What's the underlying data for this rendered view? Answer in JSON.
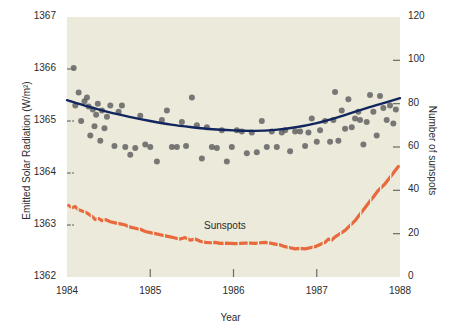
{
  "chart_data": {
    "type": "scatter",
    "title": "",
    "xlabel": "Year",
    "ylabel": "Emitted Solar Radiation (W/m²)",
    "ylabel_right": "Number of sunspots",
    "xlim": [
      1984,
      1988
    ],
    "ylim": [
      1362,
      1367
    ],
    "ylim_right": [
      0,
      120
    ],
    "grid": false,
    "legend": "none",
    "plot_background": "#eceadb",
    "xticks": [
      1984,
      1985,
      1986,
      1987,
      1988
    ],
    "xtick_labels": [
      "1984",
      "1985",
      "1986",
      "1987",
      "1988"
    ],
    "yticks_left": [
      1362,
      1363,
      1364,
      1365,
      1366,
      1367
    ],
    "ytick_labels_left": [
      "1362",
      "1363",
      "1364",
      "1365",
      "1366",
      "1367"
    ],
    "yticks_right": [
      0,
      20,
      40,
      60,
      80,
      100,
      120
    ],
    "ytick_labels_right": [
      "0",
      "20",
      "40",
      "60",
      "80",
      "100",
      "120"
    ],
    "annotations": [
      {
        "text": "Sunspots",
        "x": 1986.2,
        "y_right": 22
      }
    ],
    "series": [
      {
        "name": "Emitted Solar Radiation",
        "type": "scatter",
        "axis": "left",
        "color": "#5e5e5e",
        "marker": "circle",
        "marker_size": 6,
        "points": [
          [
            1984.08,
            1366.02
          ],
          [
            1984.1,
            1365.3
          ],
          [
            1984.14,
            1365.55
          ],
          [
            1984.17,
            1365.0
          ],
          [
            1984.21,
            1365.38
          ],
          [
            1984.24,
            1365.45
          ],
          [
            1984.26,
            1365.28
          ],
          [
            1984.28,
            1364.72
          ],
          [
            1984.31,
            1365.22
          ],
          [
            1984.33,
            1364.9
          ],
          [
            1984.35,
            1365.12
          ],
          [
            1984.37,
            1365.33
          ],
          [
            1984.4,
            1364.62
          ],
          [
            1984.42,
            1365.2
          ],
          [
            1984.45,
            1364.86
          ],
          [
            1984.48,
            1365.08
          ],
          [
            1984.52,
            1365.3
          ],
          [
            1984.57,
            1364.52
          ],
          [
            1984.62,
            1365.18
          ],
          [
            1984.66,
            1365.3
          ],
          [
            1984.7,
            1364.5
          ],
          [
            1984.76,
            1364.35
          ],
          [
            1984.82,
            1364.48
          ],
          [
            1984.88,
            1365.1
          ],
          [
            1984.94,
            1364.55
          ],
          [
            1985.0,
            1364.5
          ],
          [
            1985.08,
            1364.22
          ],
          [
            1985.14,
            1365.02
          ],
          [
            1985.2,
            1365.2
          ],
          [
            1985.26,
            1364.5
          ],
          [
            1985.32,
            1364.5
          ],
          [
            1985.38,
            1364.98
          ],
          [
            1985.43,
            1364.52
          ],
          [
            1985.5,
            1365.45
          ],
          [
            1985.56,
            1364.92
          ],
          [
            1985.62,
            1364.28
          ],
          [
            1985.68,
            1364.88
          ],
          [
            1985.74,
            1364.5
          ],
          [
            1985.8,
            1364.48
          ],
          [
            1985.86,
            1364.82
          ],
          [
            1985.92,
            1364.22
          ],
          [
            1985.98,
            1364.5
          ],
          [
            1986.04,
            1364.82
          ],
          [
            1986.1,
            1364.8
          ],
          [
            1986.16,
            1364.38
          ],
          [
            1986.22,
            1364.78
          ],
          [
            1986.28,
            1364.4
          ],
          [
            1986.34,
            1365.0
          ],
          [
            1986.4,
            1364.5
          ],
          [
            1986.46,
            1364.8
          ],
          [
            1986.52,
            1364.5
          ],
          [
            1986.58,
            1364.78
          ],
          [
            1986.62,
            1364.82
          ],
          [
            1986.68,
            1364.42
          ],
          [
            1986.74,
            1364.8
          ],
          [
            1986.8,
            1364.8
          ],
          [
            1986.86,
            1364.52
          ],
          [
            1986.9,
            1364.78
          ],
          [
            1986.94,
            1365.05
          ],
          [
            1987.0,
            1364.6
          ],
          [
            1987.04,
            1364.82
          ],
          [
            1987.1,
            1365.0
          ],
          [
            1987.16,
            1364.6
          ],
          [
            1987.2,
            1365.02
          ],
          [
            1987.22,
            1365.56
          ],
          [
            1987.26,
            1364.62
          ],
          [
            1987.3,
            1365.2
          ],
          [
            1987.34,
            1364.85
          ],
          [
            1987.38,
            1365.42
          ],
          [
            1987.42,
            1364.88
          ],
          [
            1987.46,
            1365.05
          ],
          [
            1987.5,
            1365.18
          ],
          [
            1987.52,
            1365.02
          ],
          [
            1987.56,
            1364.55
          ],
          [
            1987.6,
            1364.98
          ],
          [
            1987.64,
            1365.5
          ],
          [
            1987.68,
            1365.18
          ],
          [
            1987.72,
            1364.72
          ],
          [
            1987.76,
            1365.48
          ],
          [
            1987.8,
            1365.25
          ],
          [
            1987.84,
            1365.02
          ],
          [
            1987.88,
            1365.3
          ],
          [
            1987.92,
            1364.95
          ],
          [
            1987.95,
            1365.22
          ]
        ]
      },
      {
        "name": "Solar Radiation trend",
        "type": "line",
        "axis": "left",
        "color": "#11255e",
        "line_width": 2.4,
        "points": [
          [
            1984.0,
            1365.4
          ],
          [
            1984.25,
            1365.28
          ],
          [
            1984.5,
            1365.17
          ],
          [
            1984.75,
            1365.08
          ],
          [
            1985.0,
            1365.0
          ],
          [
            1985.25,
            1364.93
          ],
          [
            1985.5,
            1364.88
          ],
          [
            1985.75,
            1364.84
          ],
          [
            1986.0,
            1364.82
          ],
          [
            1986.25,
            1364.81
          ],
          [
            1986.5,
            1364.83
          ],
          [
            1986.75,
            1364.88
          ],
          [
            1987.0,
            1364.96
          ],
          [
            1987.25,
            1365.07
          ],
          [
            1987.5,
            1365.2
          ],
          [
            1987.75,
            1365.32
          ],
          [
            1988.0,
            1365.44
          ]
        ]
      },
      {
        "name": "Sunspots",
        "type": "line",
        "axis": "right",
        "color": "#e8693c",
        "line_width": 3.2,
        "style": "dashed-irregular",
        "points": [
          [
            1984.02,
            33.0
          ],
          [
            1984.06,
            32.0
          ],
          [
            1984.1,
            32.5
          ],
          [
            1984.14,
            31.0
          ],
          [
            1984.18,
            30.5
          ],
          [
            1984.22,
            30.0
          ],
          [
            1984.26,
            29.0
          ],
          [
            1984.3,
            28.0
          ],
          [
            1984.34,
            26.5
          ],
          [
            1984.38,
            27.0
          ],
          [
            1984.42,
            26.0
          ],
          [
            1984.46,
            26.5
          ],
          [
            1984.52,
            25.5
          ],
          [
            1984.58,
            25.0
          ],
          [
            1984.64,
            24.5
          ],
          [
            1984.7,
            24.0
          ],
          [
            1984.76,
            23.0
          ],
          [
            1984.82,
            22.5
          ],
          [
            1984.88,
            22.0
          ],
          [
            1984.94,
            21.0
          ],
          [
            1985.0,
            20.5
          ],
          [
            1985.06,
            20.0
          ],
          [
            1985.12,
            19.5
          ],
          [
            1985.18,
            19.0
          ],
          [
            1985.24,
            18.5
          ],
          [
            1985.3,
            18.0
          ],
          [
            1985.36,
            17.5
          ],
          [
            1985.42,
            18.2
          ],
          [
            1985.48,
            17.0
          ],
          [
            1985.54,
            17.5
          ],
          [
            1985.6,
            16.5
          ],
          [
            1985.66,
            16.0
          ],
          [
            1985.72,
            15.8
          ],
          [
            1985.78,
            16.0
          ],
          [
            1985.84,
            15.5
          ],
          [
            1985.9,
            15.6
          ],
          [
            1985.96,
            15.5
          ],
          [
            1986.02,
            15.4
          ],
          [
            1986.08,
            15.5
          ],
          [
            1986.14,
            15.6
          ],
          [
            1986.2,
            15.6
          ],
          [
            1986.26,
            15.5
          ],
          [
            1986.32,
            15.8
          ],
          [
            1986.38,
            16.0
          ],
          [
            1986.44,
            15.6
          ],
          [
            1986.5,
            15.2
          ],
          [
            1986.56,
            14.8
          ],
          [
            1986.62,
            14.0
          ],
          [
            1986.68,
            13.5
          ],
          [
            1986.74,
            13.0
          ],
          [
            1986.8,
            13.2
          ],
          [
            1986.86,
            13.0
          ],
          [
            1986.92,
            13.5
          ],
          [
            1986.98,
            14.0
          ],
          [
            1987.04,
            15.0
          ],
          [
            1987.1,
            16.0
          ],
          [
            1987.14,
            17.5
          ],
          [
            1987.18,
            17.0
          ],
          [
            1987.22,
            18.5
          ],
          [
            1987.26,
            19.5
          ],
          [
            1987.3,
            20.5
          ],
          [
            1987.34,
            21.5
          ],
          [
            1987.38,
            23.0
          ],
          [
            1987.42,
            24.5
          ],
          [
            1987.46,
            26.0
          ],
          [
            1987.5,
            28.0
          ],
          [
            1987.54,
            30.0
          ],
          [
            1987.58,
            32.0
          ],
          [
            1987.62,
            34.0
          ],
          [
            1987.66,
            36.0
          ],
          [
            1987.7,
            38.0
          ],
          [
            1987.74,
            40.0
          ],
          [
            1987.78,
            41.5
          ],
          [
            1987.82,
            43.0
          ],
          [
            1987.86,
            45.0
          ],
          [
            1987.9,
            47.0
          ],
          [
            1987.94,
            49.0
          ],
          [
            1987.98,
            51.0
          ]
        ]
      }
    ]
  },
  "figure": {
    "xlabel": "Year",
    "ylabel_left": "Emitted Solar Radiation (W/m²)",
    "ylabel_right": "Number of sunspots",
    "sunspots_label": "Sunspots"
  }
}
